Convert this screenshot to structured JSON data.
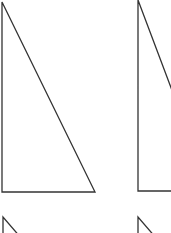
{
  "diagram": {
    "stroke_color": "#333333",
    "background": "#ffffff",
    "shapes": [
      {
        "name": "triangle-1",
        "points": "2,2 2,192 95,192"
      },
      {
        "name": "triangle-2",
        "points": "138,0 138,191 210,191"
      },
      {
        "name": "triangle-3-partial",
        "points": "3,217 3,260 40,260"
      },
      {
        "name": "triangle-4-partial",
        "points": "138,217 138,260 175,260"
      }
    ]
  }
}
